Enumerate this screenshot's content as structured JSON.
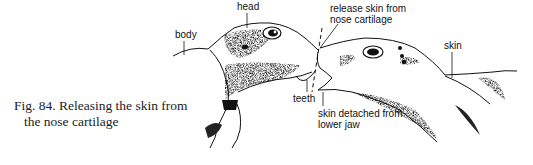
{
  "figure": {
    "caption_line1": "Fig. 84. Releasing the skin from",
    "caption_line2": "the nose cartilage"
  },
  "labels": {
    "head": "head",
    "body": "body",
    "release_line1": "release skin from",
    "release_line2": "nose cartilage",
    "skin": "skin",
    "teeth": "teeth",
    "detached_line1": "skin detached from",
    "detached_line2": "lower jaw"
  },
  "colors": {
    "ink": "#111111",
    "shade": "#555555",
    "background": "#ffffff"
  }
}
